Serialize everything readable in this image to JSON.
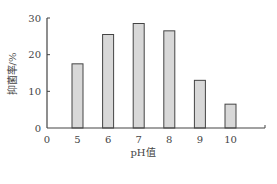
{
  "chart_data": {
    "type": "bar",
    "title": "",
    "xlabel": "pH值",
    "ylabel": "抑菌率/%",
    "categories": [
      "5",
      "6",
      "7",
      "8",
      "9",
      "10"
    ],
    "values": [
      17.5,
      25.5,
      28.5,
      26.5,
      13,
      6.5
    ],
    "x_ticks": [
      "0",
      "5",
      "6",
      "7",
      "8",
      "9",
      "10"
    ],
    "y_ticks": [
      0,
      10,
      20,
      30
    ],
    "ylim": [
      0,
      30
    ],
    "grid": false,
    "legend": null,
    "colors": {
      "bar_fill": "#d8d8d8",
      "bar_stroke": "#444444",
      "axis": "#444444"
    }
  }
}
